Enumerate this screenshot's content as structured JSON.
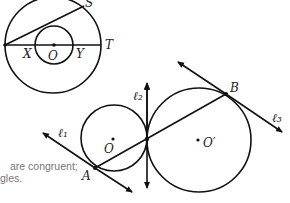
{
  "figure_top": {
    "labels": {
      "S": "S",
      "T": "T",
      "X": "X",
      "O": "O",
      "Y": "Y"
    }
  },
  "figure_bottom": {
    "labels": {
      "l1": "ℓ₁",
      "l2": "ℓ₂",
      "l3": "ℓ₃",
      "A": "A",
      "B": "B",
      "O": "O",
      "Oprime": "O′"
    }
  },
  "caption": {
    "line1": "are congruent;",
    "line2": "gles."
  },
  "colors": {
    "stroke": "#111111",
    "caption": "#777777"
  }
}
